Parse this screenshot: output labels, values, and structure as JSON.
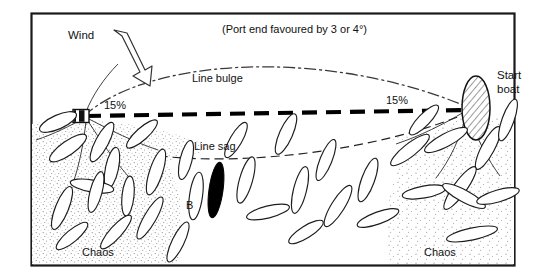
{
  "figure": {
    "kind": "sailing-start-line-diagram",
    "background_color": "#ffffff",
    "frame_color": "#1a1a1a",
    "ink_color": "#111111",
    "stipple_color": "#8a8a8a"
  },
  "labels": {
    "wind": "Wind",
    "note": "(Port end favoured by 3 or 4°)",
    "line_bulge": "Line bulge",
    "line_sag": "Line sag",
    "percent_left": "15%",
    "percent_right": "15%",
    "start_boat_line1": "Start",
    "start_boat_line2": "boat",
    "boat_b": "B",
    "chaos_left": "Chaos",
    "chaos_right": "Chaos"
  },
  "elements": {
    "start_line": {
      "name": "start-line",
      "style": "thick-dashed",
      "color": "#000000",
      "x1": 82,
      "y1": 116,
      "x2": 470,
      "y2": 110
    },
    "bulge_curve": {
      "name": "line-bulge-curve",
      "style": "dash-dot",
      "peak_y": 71
    },
    "sag_curve": {
      "name": "line-sag-curve",
      "style": "dashed",
      "low_y": 152,
      "has_arrowhead": true
    },
    "port_mark": {
      "name": "port-end-mark",
      "shape": "rect-buoy",
      "x": 73,
      "y": 110,
      "width": 16,
      "height": 13
    },
    "start_boat": {
      "name": "start-boat",
      "shape": "hatched-ellipse",
      "cx": 476,
      "cy": 109,
      "rx": 14,
      "ry": 32
    },
    "boat_b": {
      "name": "boat-b",
      "shape": "filled-lens",
      "fill": "#000000"
    },
    "chaos_zones": [
      {
        "name": "chaos-zone-left",
        "side": "left"
      },
      {
        "name": "chaos-zone-right",
        "side": "right"
      }
    ]
  },
  "fleet": {
    "count_outline_boats": 34,
    "description": "outlined lens-shaped dinghies crowded at both line ends"
  }
}
